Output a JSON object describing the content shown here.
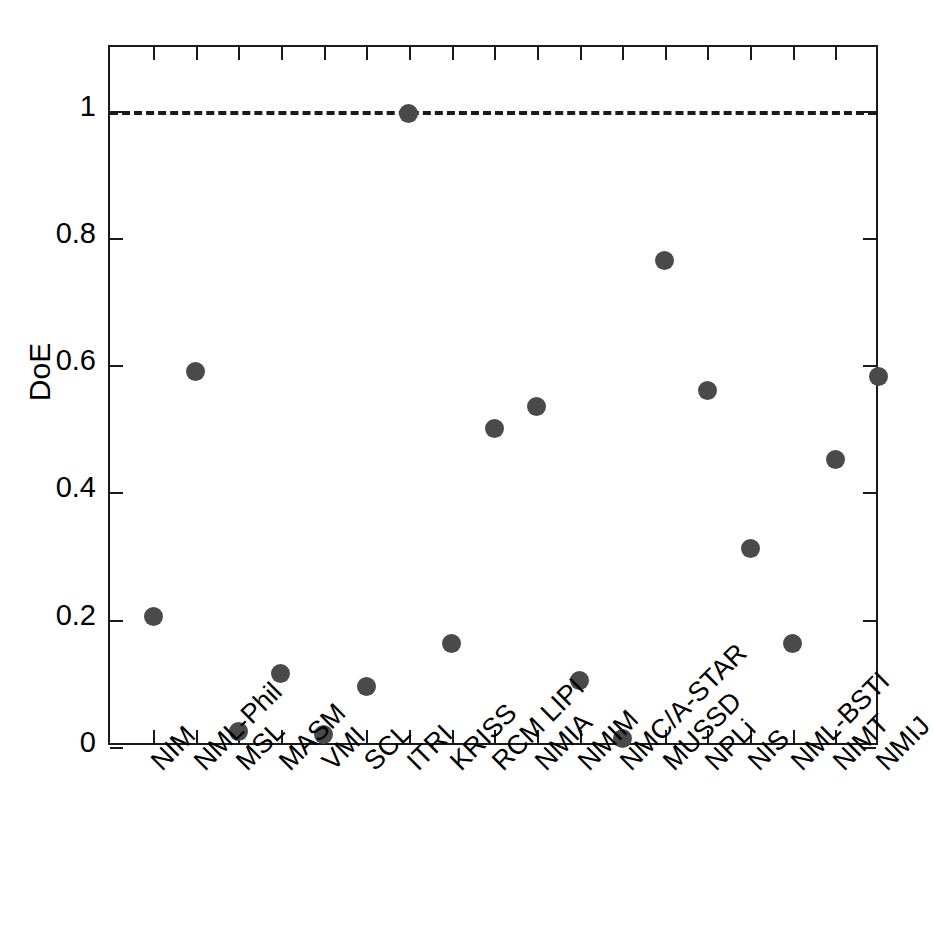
{
  "chart_data": {
    "type": "scatter",
    "title": "",
    "xlabel": "",
    "ylabel": "DoE",
    "ylim": [
      0,
      1.1
    ],
    "ytick_values": [
      0,
      0.2,
      0.4,
      0.6,
      0.8,
      1
    ],
    "ytick_labels": [
      "0",
      "0.2",
      "0.4",
      "0.6",
      "0.8",
      "1"
    ],
    "grid": false,
    "legend": "none",
    "marker": "filled-circle",
    "marker_color": "#4a4a4a",
    "reference_line": {
      "value": 1,
      "style": "dashed",
      "color": "#1a1a1a",
      "label": ""
    },
    "categories": [
      "NIM",
      "NML-Phil",
      "MSL",
      "MASM",
      "VMI",
      "SCL",
      "ITRI",
      "KRISS",
      "RCM LIPI",
      "NMIA",
      "NMIM",
      "NMC/A-STAR",
      "MUSSD",
      "NPLi",
      "NIS",
      "NML-BSTI",
      "NIMT",
      "NMIJ"
    ],
    "values": [
      0.205,
      0.59,
      0.025,
      0.115,
      0.02,
      0.095,
      0.995,
      0.163,
      0.5,
      0.535,
      0.105,
      0.013,
      0.765,
      0.56,
      0.312,
      0.162,
      0.452,
      0.583
    ]
  },
  "axes": {
    "frame_color": "#1a1a1a",
    "background": "#ffffff"
  }
}
